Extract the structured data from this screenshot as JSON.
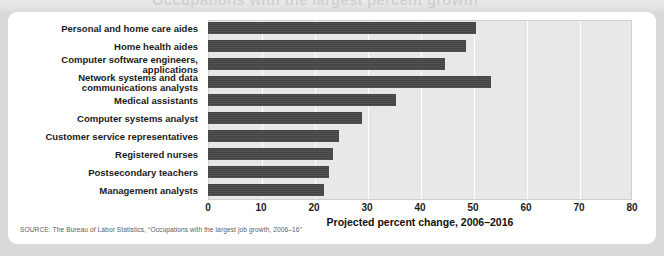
{
  "page": {
    "cropped_title_fragment": "Occupations with the largest percent growth"
  },
  "chart_data": {
    "type": "bar",
    "orientation": "horizontal",
    "title": "",
    "xlabel": "Projected percent change, 2006–2016",
    "ylabel": "",
    "xlim": [
      0,
      80
    ],
    "xticks": [
      0,
      10,
      20,
      30,
      40,
      50,
      60,
      70,
      80
    ],
    "grid": true,
    "legend": null,
    "bar_color": "#484848",
    "plot_background": "#e8e8e8",
    "categories": [
      "Personal and home care aides",
      "Home health aides",
      "Computer software engineers, applications",
      "Network systems and data communications analysts",
      "Medical assistants",
      "Computer systems analyst",
      "Customer service representatives",
      "Registered nurses",
      "Postsecondary teachers",
      "Management analysts"
    ],
    "category_lines": [
      [
        "Personal and home care aides"
      ],
      [
        "Home health aides"
      ],
      [
        "Computer software engineers, applications"
      ],
      [
        "Network systems and data",
        "communications analysts"
      ],
      [
        "Medical assistants"
      ],
      [
        "Computer systems analyst"
      ],
      [
        "Customer service representatives"
      ],
      [
        "Registered nurses"
      ],
      [
        "Postsecondary teachers"
      ],
      [
        "Management analysts"
      ]
    ],
    "values": [
      50.6,
      48.7,
      44.7,
      53.4,
      35.4,
      29.0,
      24.8,
      23.5,
      22.9,
      21.9
    ]
  },
  "source": {
    "note": "SOURCE: The Bureau of Labor Statistics, “Occupations with the largest job growth, 2006–16”"
  }
}
